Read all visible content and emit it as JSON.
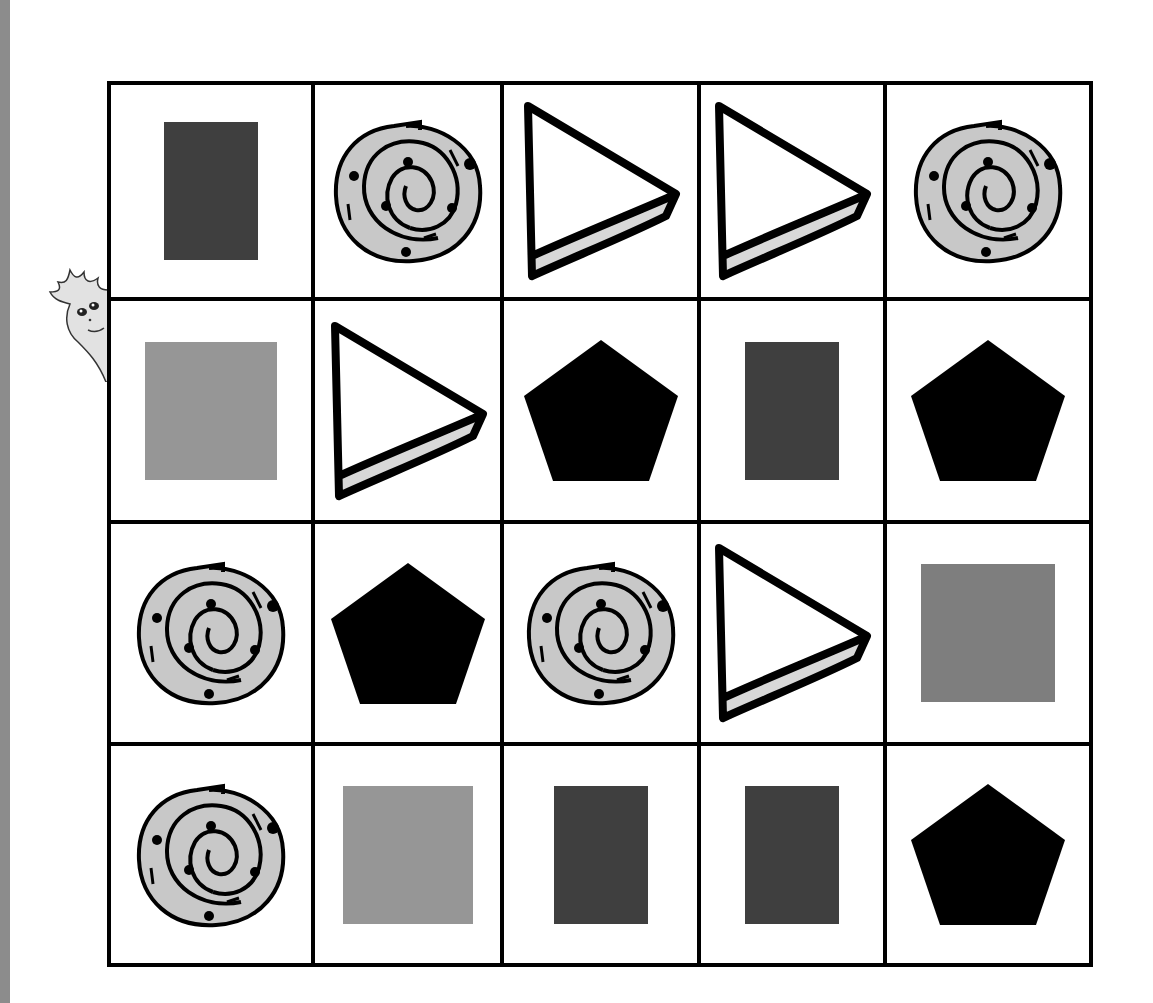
{
  "colors": {
    "edge_bar": "#8c8c8c",
    "dark_rect": "#3f3f3f",
    "mid_square": "#7e7e7e",
    "light_square": "#969696",
    "swirl_fill": "#c8c8c8",
    "outline": "#000000"
  },
  "grid": {
    "rows": 4,
    "cols": 5,
    "cells": [
      [
        {
          "shape": "rectangle",
          "tone": "dark",
          "w": 94,
          "h": 138
        },
        {
          "shape": "swirl"
        },
        {
          "shape": "triangle"
        },
        {
          "shape": "triangle"
        },
        {
          "shape": "swirl"
        }
      ],
      [
        {
          "shape": "square",
          "tone": "light",
          "w": 132,
          "h": 138
        },
        {
          "shape": "triangle"
        },
        {
          "shape": "pentagon"
        },
        {
          "shape": "rectangle",
          "tone": "dark",
          "w": 94,
          "h": 138
        },
        {
          "shape": "pentagon"
        }
      ],
      [
        {
          "shape": "swirl"
        },
        {
          "shape": "pentagon"
        },
        {
          "shape": "swirl"
        },
        {
          "shape": "triangle"
        },
        {
          "shape": "square",
          "tone": "mid",
          "w": 134,
          "h": 138
        }
      ],
      [
        {
          "shape": "swirl"
        },
        {
          "shape": "rectangle",
          "tone": "light",
          "w": 130,
          "h": 138
        },
        {
          "shape": "rectangle",
          "tone": "dark",
          "w": 94,
          "h": 138
        },
        {
          "shape": "rectangle",
          "tone": "dark",
          "w": 94,
          "h": 138
        },
        {
          "shape": "pentagon"
        }
      ]
    ]
  }
}
